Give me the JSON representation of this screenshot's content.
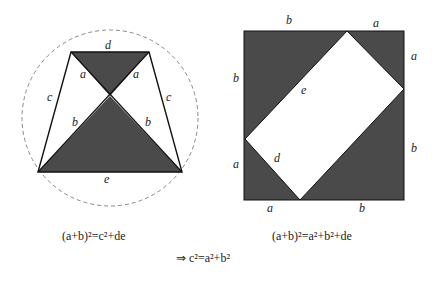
{
  "colors": {
    "fill": "#4a4a4a",
    "stroke": "#111111",
    "circle": "#888888",
    "background": "#ffffff"
  },
  "left_figure": {
    "labels": {
      "top": "d",
      "bottom": "e",
      "upper_left_diag": "a",
      "upper_right_diag": "a",
      "lower_left_diag": "b",
      "lower_right_diag": "b",
      "left_side": "c",
      "right_side": "c"
    },
    "caption": "(a+b)²=c²+de"
  },
  "right_figure": {
    "labels": {
      "top_left": "b",
      "top_right": "a",
      "right_upper": "a",
      "right_lower": "b",
      "left_upper": "b",
      "left_lower": "a",
      "bottom_left": "a",
      "bottom_right": "b",
      "rect_long": "e",
      "rect_short": "d"
    },
    "caption": "(a+b)²=a²+b²+de"
  },
  "conclusion": "⇒ c²=a²+b²"
}
